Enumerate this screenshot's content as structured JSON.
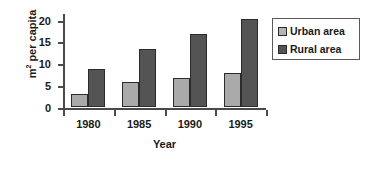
{
  "chart_data": {
    "type": "bar",
    "title": "",
    "xlabel": "Year",
    "ylabel": "m² per capita",
    "ylabel_base": "m",
    "ylabel_sup": "2",
    "ylabel_rest": " per capita",
    "categories": [
      "1980",
      "1985",
      "1990",
      "1995"
    ],
    "series": [
      {
        "name": "Urban area",
        "color": "#aaaaaa",
        "values": [
          3.0,
          5.7,
          6.7,
          7.7
        ]
      },
      {
        "name": "Rural area",
        "color": "#545454",
        "values": [
          8.8,
          13.2,
          16.6,
          20.2
        ]
      }
    ],
    "ylim": [
      0,
      21.5
    ],
    "yticks": [
      0,
      5,
      10,
      15,
      20
    ],
    "ytick_labels": [
      "0",
      "5",
      "10",
      "15",
      "20"
    ],
    "grid": false,
    "legend_position": "right"
  },
  "legend": {
    "entries": [
      {
        "label": "Urban area",
        "color": "#aaaaaa"
      },
      {
        "label": "Rural area",
        "color": "#545454"
      }
    ]
  }
}
